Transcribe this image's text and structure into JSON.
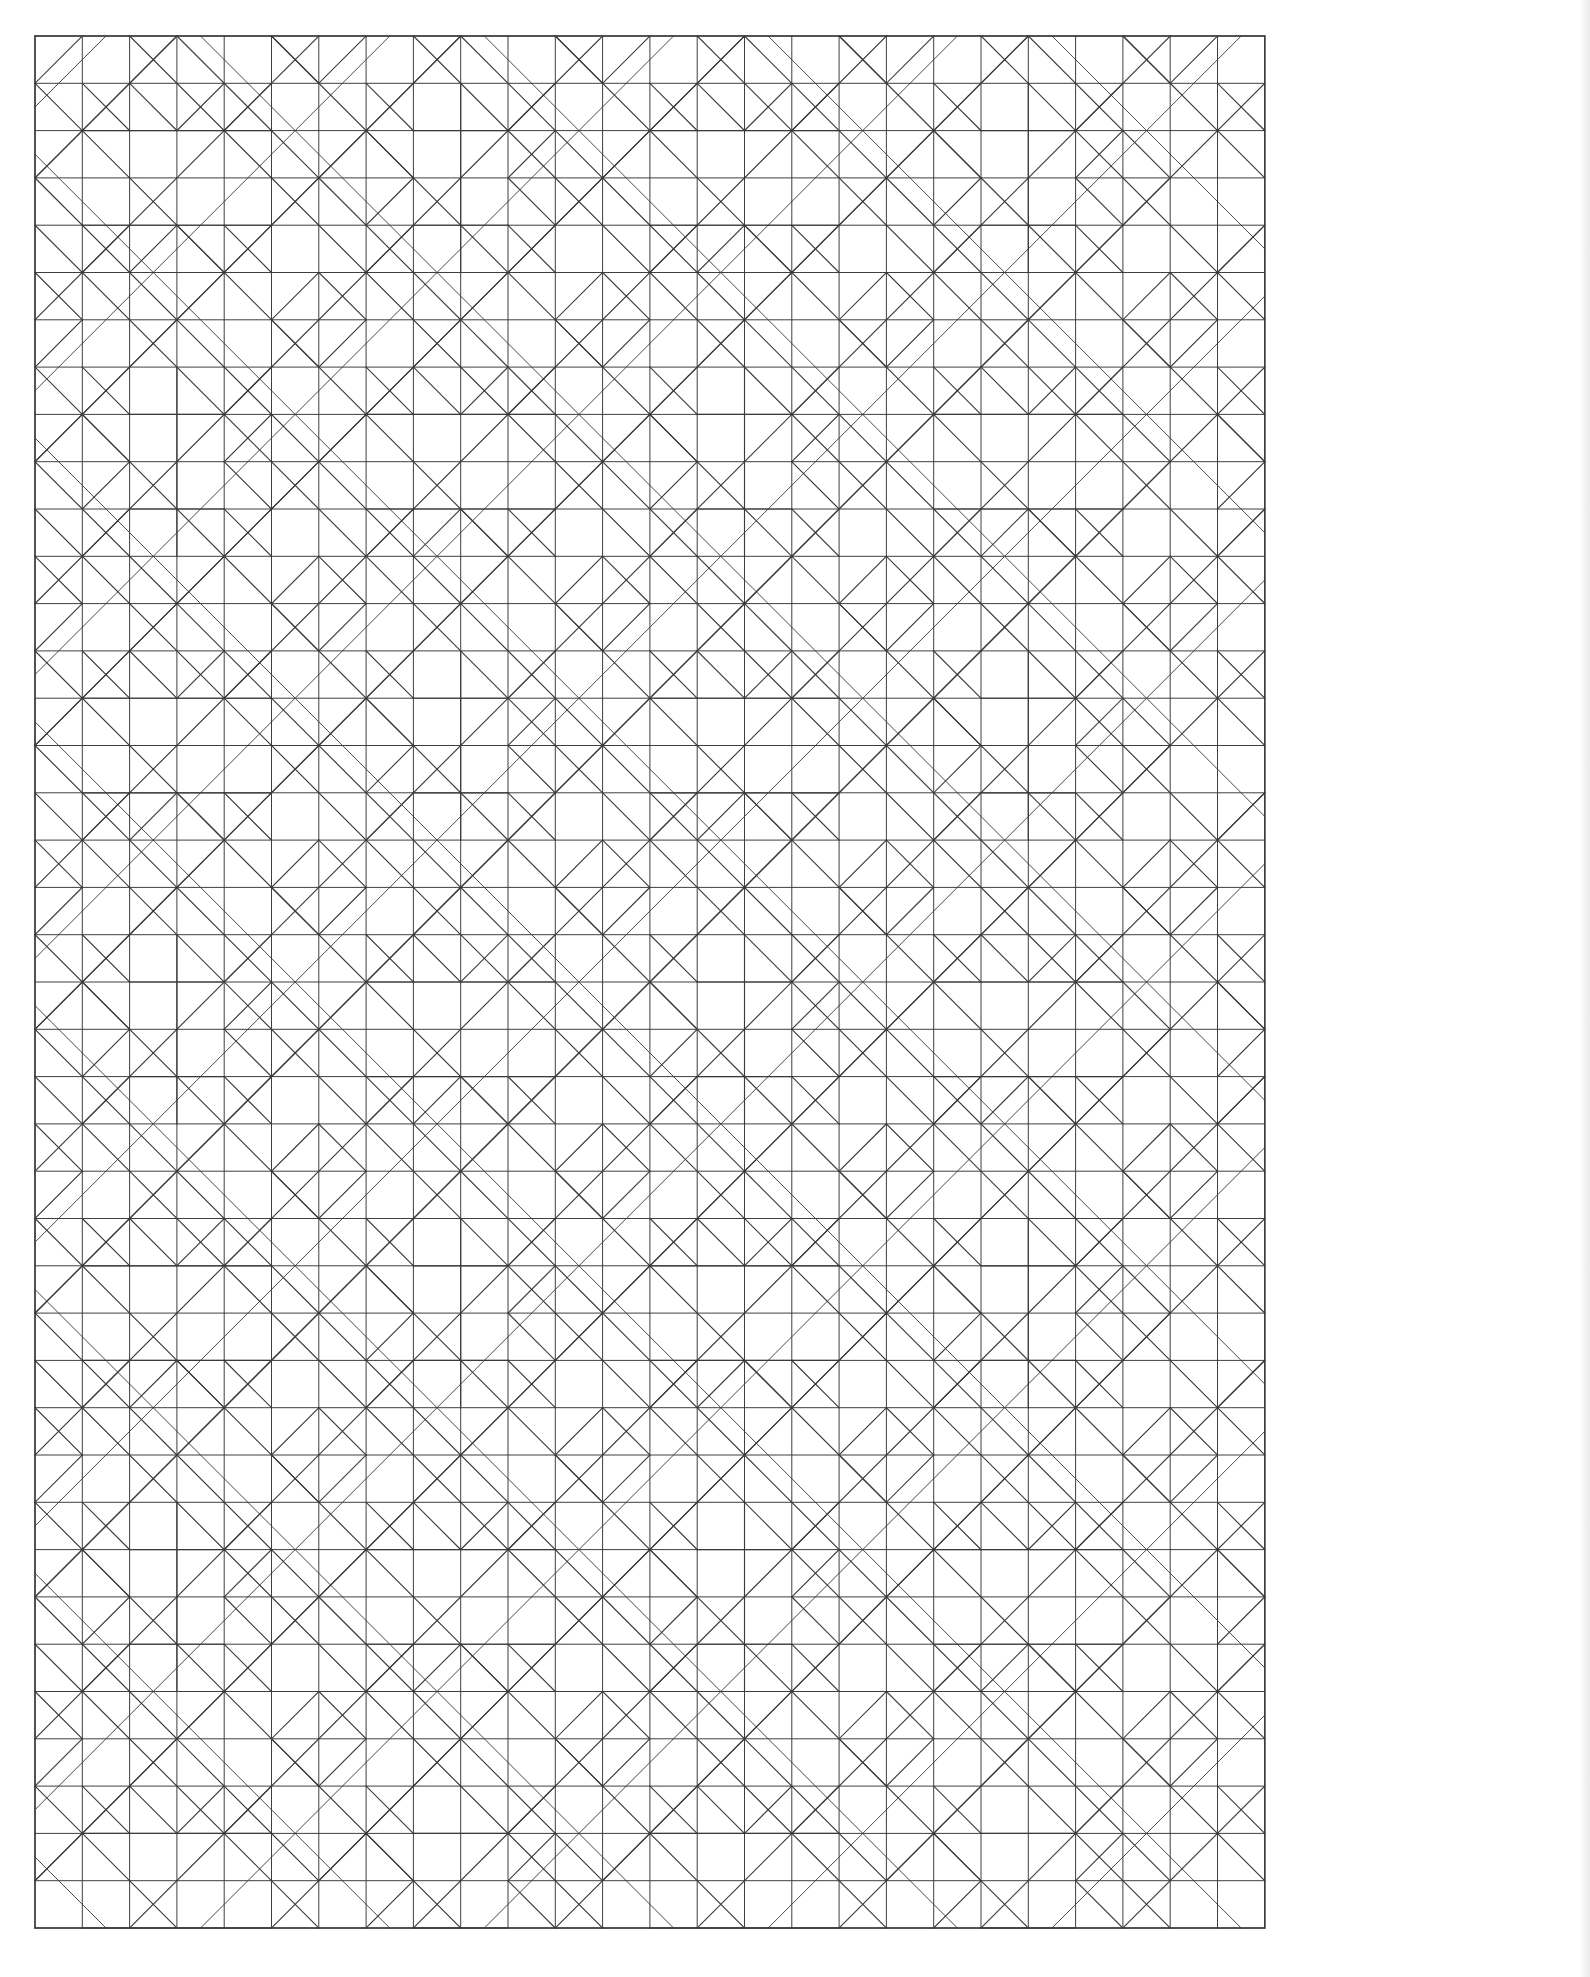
{
  "document": {
    "title": "Geometric Quilt Lattice Pattern",
    "kind": "line-art-pattern",
    "background_color": "#ffffff",
    "stroke_color": "#3a3a3a",
    "stroke_width": 1.15,
    "canvas": {
      "width": 1590,
      "height": 1977
    }
  },
  "grid": {
    "origin_x": 35,
    "origin_y": 36,
    "cell": 47.3,
    "cols": 26,
    "rows": 40,
    "border": true,
    "description": "Square lattice underlying the diagonal quilt motif"
  },
  "motif": {
    "block_cells": 6,
    "repeat_x": 4.33,
    "repeat_y": 6.67,
    "elements": [
      "outer-square-border",
      "full-grid-lines",
      "diagonal-diamond-lattice",
      "nested-chevrons",
      "half-square-triangles",
      "stacked-lens-bands"
    ]
  },
  "legend": {
    "note": "No text labels appear in this image; it is a pure line-art geometric pattern."
  }
}
